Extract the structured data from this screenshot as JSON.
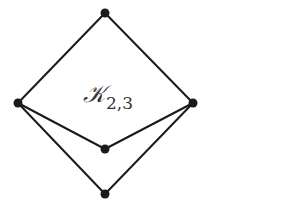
{
  "diagram": {
    "label": {
      "main": "𝒦",
      "subscript": "2,3"
    },
    "colors": {
      "stroke": "#1a1a1a",
      "node": "#1a1a1a",
      "background": "#ffffff"
    },
    "nodes": [
      {
        "id": "top",
        "x": 105,
        "y": 13
      },
      {
        "id": "left",
        "x": 18,
        "y": 103
      },
      {
        "id": "right",
        "x": 193,
        "y": 103
      },
      {
        "id": "middle",
        "x": 105,
        "y": 149
      },
      {
        "id": "bottom",
        "x": 105,
        "y": 194
      }
    ],
    "edges": [
      [
        "left",
        "top"
      ],
      [
        "right",
        "top"
      ],
      [
        "left",
        "middle"
      ],
      [
        "right",
        "middle"
      ],
      [
        "left",
        "bottom"
      ],
      [
        "right",
        "bottom"
      ]
    ]
  }
}
